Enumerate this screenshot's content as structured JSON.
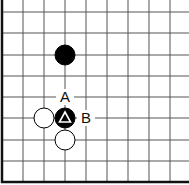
{
  "board": {
    "type": "go-board-corner",
    "edges": [
      "left",
      "bottom"
    ],
    "grid_x": [
      2,
      23,
      44,
      65,
      86,
      107,
      128,
      149,
      170
    ],
    "grid_y": [
      12,
      33,
      55,
      76,
      97,
      118,
      140,
      161,
      182
    ],
    "line_color": "#555555",
    "edge_color": "#111111"
  },
  "stones": [
    {
      "color": "black",
      "col": 3,
      "row": 2,
      "marker": null
    },
    {
      "color": "white",
      "col": 2,
      "row": 5,
      "marker": null
    },
    {
      "color": "black",
      "col": 3,
      "row": 5,
      "marker": "triangle"
    },
    {
      "color": "white",
      "col": 3,
      "row": 6,
      "marker": null
    }
  ],
  "labels": [
    {
      "text": "A",
      "col": 3,
      "row": 4
    },
    {
      "text": "B",
      "col": 4,
      "row": 5
    }
  ]
}
